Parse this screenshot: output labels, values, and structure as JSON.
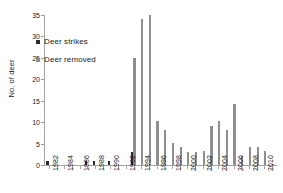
{
  "chart_data": {
    "type": "bar",
    "title": "",
    "xlabel": "",
    "ylabel": "No. of deer",
    "ylim": [
      0,
      35
    ],
    "y_ticks": [
      0,
      5,
      10,
      15,
      20,
      25,
      30,
      35
    ],
    "grid": false,
    "legend_position": "upper-left",
    "x": [
      1982,
      1983,
      1984,
      1985,
      1986,
      1987,
      1988,
      1989,
      1990,
      1991,
      1992,
      1993,
      1994,
      1995,
      1996,
      1997,
      1998,
      1999,
      2000,
      2001,
      2002,
      2003,
      2004,
      2005,
      2006,
      2007,
      2008,
      2009,
      2010,
      2011
    ],
    "x_tick_labels": [
      "1982",
      "1984",
      "1986",
      "1988",
      "1990",
      "1992",
      "1994",
      "1996",
      "1998",
      "2000",
      "2002",
      "2004",
      "2006",
      "2008",
      "2010"
    ],
    "series": [
      {
        "name": "Deer strikes",
        "color": "#2b2b2b",
        "values": [
          1,
          0,
          0,
          0,
          0,
          1,
          1,
          0,
          1,
          0,
          0,
          3,
          0,
          0,
          0,
          0,
          0,
          0,
          0,
          0,
          0,
          0,
          0,
          0,
          0,
          0,
          0,
          0,
          0,
          0
        ]
      },
      {
        "name": "Deer removed",
        "color": "#8e8e8e",
        "values": [
          0,
          0,
          0,
          0,
          0,
          0,
          0,
          0,
          0,
          0,
          0,
          25,
          34,
          35,
          10.2,
          8.1,
          5.2,
          4.3,
          3.1,
          3.1,
          3.2,
          9.2,
          10.2,
          8.1,
          14.2,
          2.2,
          4.2,
          4.2,
          3.2,
          0.3
        ]
      }
    ]
  },
  "legend": {
    "items": [
      {
        "label": "Deer strikes",
        "color": "#2b2b2b"
      },
      {
        "label": "Deer removed",
        "color": "#8e8e8e"
      }
    ]
  },
  "axis": {
    "y_title": "No. of deer"
  }
}
